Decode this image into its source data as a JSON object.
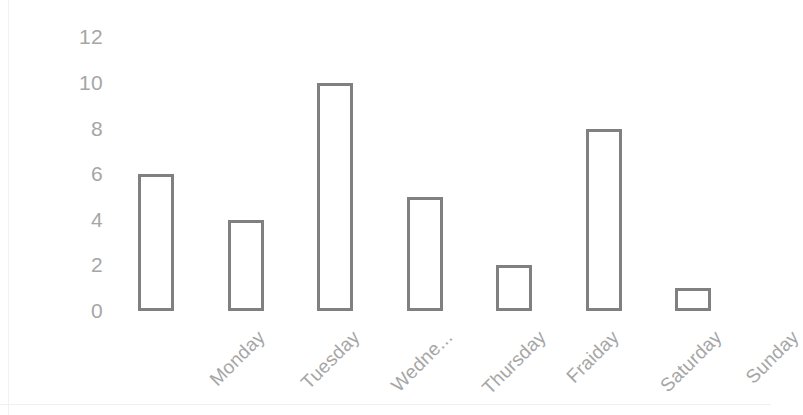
{
  "chart_data": {
    "type": "bar",
    "title": "",
    "subtitle": "",
    "xlabel": "",
    "ylabel": "",
    "categories": [
      "Monday",
      "Tuesday",
      "Wedne...",
      "Thursday",
      "Fraiday",
      "Saturday",
      "Sunday"
    ],
    "values": [
      6,
      4,
      10,
      5,
      2,
      8,
      1
    ],
    "ylim": [
      0,
      12
    ],
    "ytick_labels": [
      "12",
      "10",
      "8",
      "6",
      "4",
      "2",
      "0"
    ],
    "ytick_values": [
      12,
      10,
      8,
      6,
      4,
      2,
      0
    ],
    "grid": false,
    "legend": null,
    "annotations": [],
    "notes": {
      "xlabel_rotation_degrees": -45,
      "bar_style": "outlined",
      "truncated_category_index": 2,
      "bar_fill_color": "#ffffff",
      "bar_stroke_color": "#808080",
      "tick_label_color": "#a6a6a6",
      "background_color": "#ffffff"
    }
  }
}
